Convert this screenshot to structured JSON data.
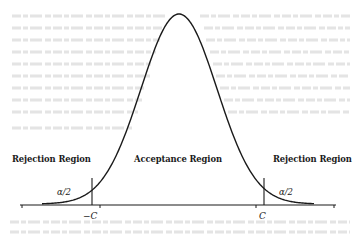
{
  "diagram": {
    "type": "normal-distribution-two-tailed-test",
    "labels": {
      "left_region": "Rejection Region",
      "center_region": "Acceptance Region",
      "right_region": "Rejection Region",
      "left_tail_area": "α/2",
      "right_tail_area": "α/2",
      "left_critical_value": "−C",
      "right_critical_value": "C"
    },
    "colors": {
      "ink": "#1a1a1a",
      "background": "#ffffff"
    }
  },
  "chart_data": {
    "type": "line",
    "title": "",
    "xlabel": "",
    "ylabel": "",
    "x_ticks": [
      "−C",
      "C"
    ],
    "critical_values": [
      -1.96,
      1.96
    ],
    "tail_area_each": "α/2",
    "regions": [
      {
        "name": "Rejection Region",
        "range": [
          "-inf",
          "−C"
        ]
      },
      {
        "name": "Acceptance Region",
        "range": [
          "−C",
          "C"
        ]
      },
      {
        "name": "Rejection Region",
        "range": [
          "C",
          "inf"
        ]
      }
    ],
    "grid": false,
    "legend": "none"
  }
}
